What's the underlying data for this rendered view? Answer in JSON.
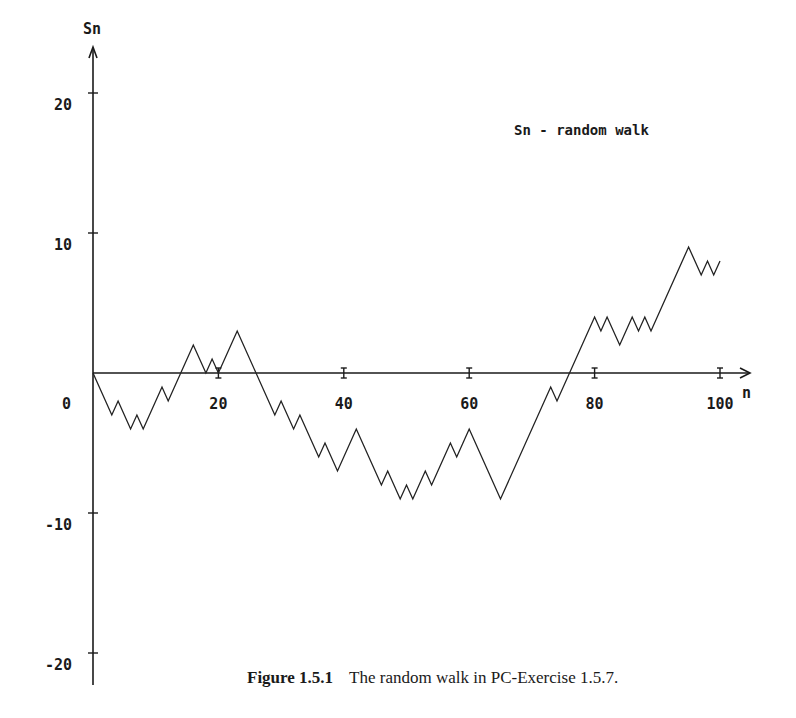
{
  "chart_data": {
    "type": "line",
    "title": "Sn - random walk",
    "xlabel": "n",
    "ylabel": "Sn",
    "xlim": [
      0,
      100
    ],
    "ylim": [
      -20,
      20
    ],
    "x_ticks": [
      20,
      40,
      60,
      80,
      100
    ],
    "x_tick_labels": [
      "20",
      "40",
      "60",
      "80",
      "100"
    ],
    "origin_label": "0",
    "y_ticks": [
      20,
      10,
      -10,
      -20
    ],
    "y_tick_labels": [
      "20",
      "10",
      "-10",
      "-20"
    ],
    "grid": false,
    "legend": "Sn - random walk",
    "series": [
      {
        "name": "Sn",
        "turning_points_n": [
          0,
          3,
          4,
          6,
          7,
          8,
          11,
          12,
          16,
          18,
          19,
          20,
          23,
          29,
          30,
          32,
          33,
          36,
          37,
          39,
          42,
          46,
          47,
          49,
          50,
          51,
          53,
          54,
          57,
          58,
          60,
          65,
          73,
          74,
          80,
          81,
          82,
          84,
          86,
          87,
          88,
          89,
          95,
          97,
          98,
          99,
          100
        ],
        "turning_points_s": [
          0,
          -3,
          -2,
          -4,
          -3,
          -4,
          -1,
          -2,
          2,
          0,
          1,
          0,
          3,
          -3,
          -2,
          -4,
          -3,
          -6,
          -5,
          -7,
          -4,
          -8,
          -7,
          -9,
          -8,
          -9,
          -7,
          -8,
          -5,
          -6,
          -4,
          -9,
          -1,
          -2,
          4,
          3,
          4,
          2,
          4,
          3,
          4,
          3,
          9,
          7,
          8,
          7,
          8
        ]
      }
    ]
  },
  "caption": {
    "figure_label": "Figure 1.5.1",
    "text": "The random walk in PC-Exercise 1.5.7."
  }
}
